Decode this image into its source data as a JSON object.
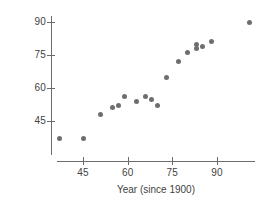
{
  "chart_data": {
    "type": "scatter",
    "title": "",
    "xlabel": "Year (since 1900)",
    "ylabel": "% Responding Yes",
    "xlim": [
      36,
      104
    ],
    "ylim": [
      33,
      94
    ],
    "xticks": [
      45,
      60,
      75,
      90
    ],
    "yticks": [
      45,
      60,
      75,
      90
    ],
    "xtick_labels": [
      "45",
      "60",
      "75",
      "90"
    ],
    "ytick_labels": [
      "45",
      "60",
      "75",
      "90"
    ],
    "grid": false,
    "legend": null,
    "marker": "filled-circle",
    "marker_color": "#6e6e6e",
    "points": [
      {
        "x": 37,
        "y": 37
      },
      {
        "x": 45,
        "y": 37
      },
      {
        "x": 51,
        "y": 48
      },
      {
        "x": 55,
        "y": 51
      },
      {
        "x": 57,
        "y": 52
      },
      {
        "x": 59,
        "y": 56
      },
      {
        "x": 63,
        "y": 54
      },
      {
        "x": 66,
        "y": 56
      },
      {
        "x": 68,
        "y": 55
      },
      {
        "x": 70,
        "y": 52
      },
      {
        "x": 73,
        "y": 65
      },
      {
        "x": 77,
        "y": 72
      },
      {
        "x": 80,
        "y": 76
      },
      {
        "x": 83,
        "y": 80
      },
      {
        "x": 83,
        "y": 78
      },
      {
        "x": 85,
        "y": 79
      },
      {
        "x": 88,
        "y": 81
      },
      {
        "x": 101,
        "y": 90
      }
    ]
  },
  "axes": {
    "y_title": "% Responding Yes",
    "x_title": "Year (since 1900)"
  }
}
